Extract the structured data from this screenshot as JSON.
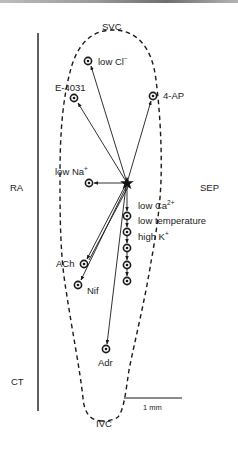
{
  "figure": {
    "regions": {
      "top": "SVC",
      "bottom": "IVC",
      "left_upper": "RA",
      "left_lower": "CT",
      "right": "SEP"
    },
    "origin_marker": "star-icon",
    "sites": [
      {
        "id": "low-cl",
        "label": "low Cl",
        "sup": "−",
        "x": 88,
        "y": 61
      },
      {
        "id": "e-4031",
        "label": "E-4031",
        "sup": "",
        "x": 74,
        "y": 98
      },
      {
        "id": "4-ap",
        "label": "4-AP",
        "sup": "",
        "x": 153,
        "y": 96
      },
      {
        "id": "low-na",
        "label": "low Na",
        "sup": "+",
        "x": 89,
        "y": 183
      },
      {
        "id": "ach",
        "label": "ACh",
        "sup": "",
        "x": 84,
        "y": 264
      },
      {
        "id": "nif",
        "label": "Nif",
        "sup": "",
        "x": 78,
        "y": 285
      },
      {
        "id": "adr",
        "label": "Adr",
        "sup": "",
        "x": 106,
        "y": 349
      }
    ],
    "chain_labels": [
      {
        "label": "low Ca",
        "sup": "2+"
      },
      {
        "label": "low temperature",
        "sup": ""
      },
      {
        "label": "high K",
        "sup": "+"
      }
    ],
    "chain_marker_y": [
      216,
      232,
      248,
      265,
      281
    ],
    "origin": {
      "x": 127,
      "y": 183
    },
    "scale_bar": {
      "label": "1 mm"
    },
    "colors": {
      "line": "#1a1a1a",
      "topbar": "#8a8a8a"
    }
  }
}
